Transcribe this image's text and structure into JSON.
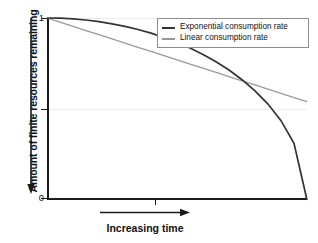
{
  "chart_data": {
    "type": "line",
    "title": "",
    "xlabel": "Increasing time",
    "ylabel": "Amount of finite resources remaining",
    "xlim": [
      0,
      1
    ],
    "ylim": [
      0,
      1
    ],
    "grid": true,
    "legend_position": "top-right",
    "x_tick_labels": [
      ""
    ],
    "y_tick_labels": [
      "1",
      "0"
    ],
    "y_ticks": [
      1,
      0.5,
      0
    ],
    "x": [
      0,
      0.05,
      0.1,
      0.15,
      0.2,
      0.25,
      0.3,
      0.35,
      0.4,
      0.45,
      0.5,
      0.55,
      0.6,
      0.65,
      0.7,
      0.75,
      0.8,
      0.85,
      0.9,
      0.95,
      1
    ],
    "series": [
      {
        "name": "Exponential consumption rate",
        "color": "#333333",
        "values": [
          1,
          0.999,
          0.995,
          0.989,
          0.98,
          0.968,
          0.954,
          0.937,
          0.917,
          0.893,
          0.866,
          0.835,
          0.8,
          0.76,
          0.714,
          0.661,
          0.6,
          0.527,
          0.436,
          0.312,
          0
        ]
      },
      {
        "name": "Linear consumption rate",
        "color": "#999999",
        "values": [
          1,
          0.977,
          0.954,
          0.931,
          0.908,
          0.885,
          0.862,
          0.839,
          0.816,
          0.793,
          0.77,
          0.747,
          0.724,
          0.701,
          0.678,
          0.655,
          0.632,
          0.609,
          0.586,
          0.563,
          0.54
        ]
      }
    ]
  },
  "legend": {
    "items": [
      {
        "label": "Exponential consumption rate",
        "color": "#333333"
      },
      {
        "label": "Linear consumption rate",
        "color": "#999999"
      }
    ]
  },
  "axes": {
    "y_title": "Amount of finite resources remaining",
    "x_title": "Increasing time",
    "y_top_label": "1",
    "y_bottom_label": "0"
  },
  "colors": {
    "exponential": "#333333",
    "linear": "#999999",
    "axis": "#1a1a1a",
    "grid": "#ededed",
    "legend_border": "#8c8c8c",
    "background": "#ffffff"
  }
}
